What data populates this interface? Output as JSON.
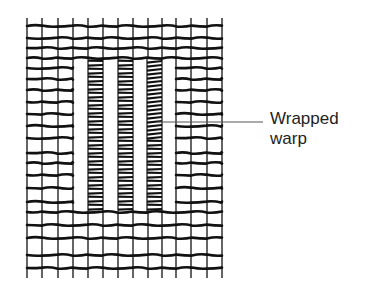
{
  "diagram": {
    "label": {
      "line1": "Wrapped",
      "line2": "warp"
    },
    "colors": {
      "ink": "#111111",
      "leader": "#555555",
      "text": "#1e1e1e",
      "background": "#ffffff"
    },
    "grid": {
      "warp_x": [
        27,
        42,
        58,
        73,
        88,
        103,
        118,
        133,
        148,
        162,
        176,
        191,
        207,
        222
      ],
      "top": 18,
      "bottom": 278,
      "full_weft_y": [
        26,
        38,
        48,
        58,
        212,
        225,
        238,
        255,
        268
      ],
      "side_weft_y": [
        68,
        79,
        90,
        102,
        114,
        126,
        138,
        153,
        163,
        175,
        188,
        202
      ],
      "gap": {
        "x1": 73,
        "x2": 176,
        "y1": 58,
        "y2": 212
      },
      "wrapped_warps": [
        {
          "x1": 88,
          "x2": 103
        },
        {
          "x1": 118,
          "x2": 133
        },
        {
          "x1": 147,
          "x2": 162
        }
      ],
      "wrap_spacing": 4
    },
    "leader_line": {
      "x1": 158,
      "y1": 122,
      "x2": 263,
      "y2": 122
    }
  }
}
